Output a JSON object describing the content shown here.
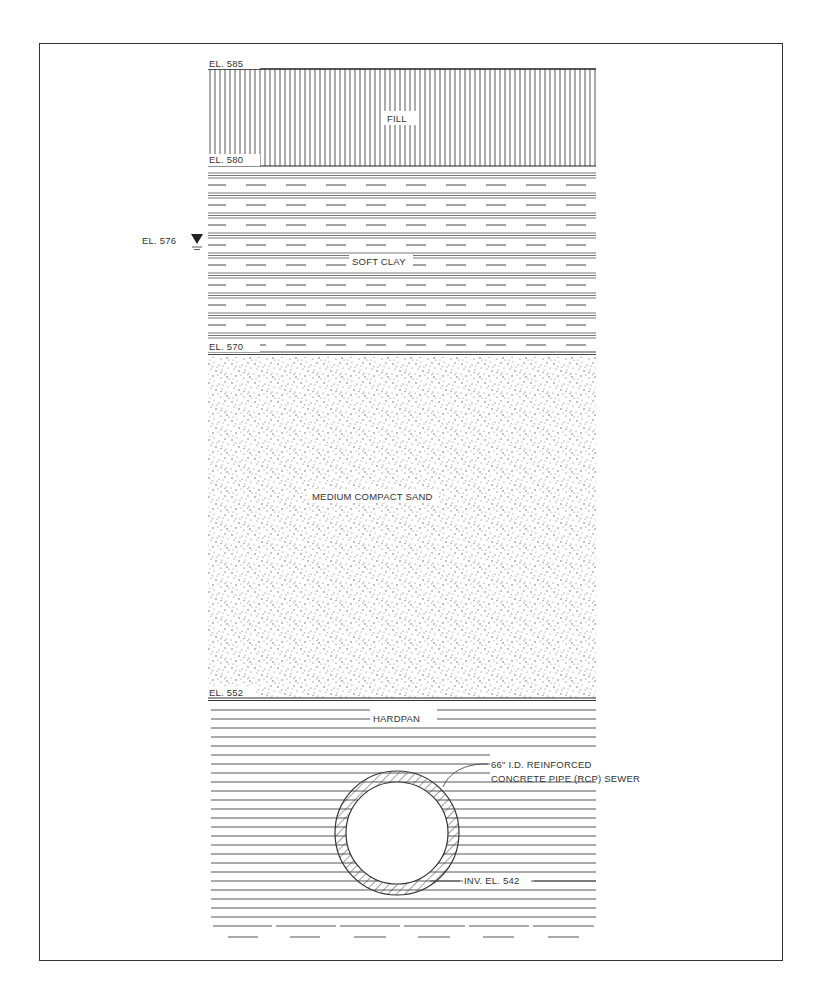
{
  "diagram": {
    "type": "soil-profile-cross-section",
    "layers": [
      {
        "name": "FILL",
        "top_el": "EL. 585",
        "bottom_el": "EL. 580",
        "pattern": "vertical-lines"
      },
      {
        "name": "SOFT CLAY",
        "top_el": "EL. 580",
        "bottom_el": "EL. 570",
        "pattern": "triple-lines-and-dashes"
      },
      {
        "name": "MEDIUM COMPACT SAND",
        "top_el": "EL. 570",
        "bottom_el": "EL. 552",
        "pattern": "stipple"
      },
      {
        "name": "HARDPAN",
        "top_el": "EL. 552",
        "bottom_el": "",
        "pattern": "horizontal-lines"
      }
    ],
    "labels": {
      "el_585": "EL. 585",
      "el_580": "EL. 580",
      "el_576": "EL. 576",
      "el_570": "EL. 570",
      "el_552": "EL. 552",
      "fill": "FILL",
      "soft_clay": "SOFT CLAY",
      "sand": "MEDIUM COMPACT SAND",
      "hardpan": "HARDPAN",
      "pipe_line1": "66\" I.D. REINFORCED",
      "pipe_line2": "CONCRETE PIPE (RCP) SEWER",
      "invert": "INV. EL. 542"
    },
    "water_table": {
      "elevation": "EL. 576",
      "symbol": "water-table-triangle-icon"
    },
    "pipe": {
      "diameter": "66\" I.D.",
      "material": "REINFORCED CONCRETE PIPE (RCP)",
      "use": "SEWER",
      "invert": "INV. EL. 542"
    }
  }
}
